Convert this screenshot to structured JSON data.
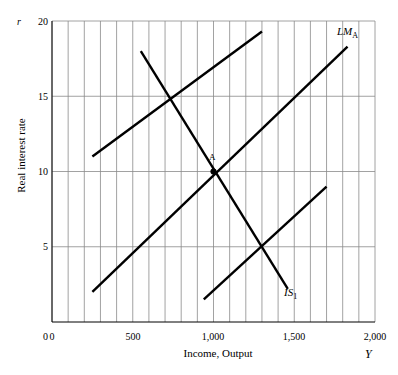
{
  "chart_data": {
    "type": "line",
    "title": "",
    "xlabel": "Income, Output",
    "ylabel": "Real interest rate",
    "x_symbol": "Y",
    "y_symbol": "r",
    "xlim": [
      0,
      2000
    ],
    "ylim": [
      0,
      20
    ],
    "xticks": [
      0,
      500,
      1000,
      1500,
      2000
    ],
    "xtick_labels": [
      "0",
      "500",
      "1,000",
      "1,500",
      "2,000"
    ],
    "yticks": [
      0,
      5,
      10,
      15,
      20
    ],
    "ytick_labels": [
      "0",
      "5",
      "10",
      "15",
      "20"
    ],
    "grid": {
      "vertical_step": 100,
      "horizontal_at": [
        5,
        10,
        15,
        20
      ],
      "color": "#808080"
    },
    "series": [
      {
        "name": "LM original",
        "label": "",
        "type": "segment",
        "points": [
          [
            250,
            11.0
          ],
          [
            1300,
            19.3
          ]
        ],
        "color": "#000000"
      },
      {
        "name": "IS1",
        "label": "IS",
        "label_sub": "1",
        "type": "segment",
        "points": [
          [
            550,
            18.0
          ],
          [
            1460,
            2.2
          ]
        ],
        "color": "#000000"
      },
      {
        "name": "LM A",
        "label": "LM",
        "label_sub": "A",
        "type": "segment",
        "points": [
          [
            250,
            2.0
          ],
          [
            1830,
            18.3
          ]
        ],
        "color": "#000000"
      },
      {
        "name": "IS shifted",
        "label": "",
        "type": "segment",
        "points": [
          [
            940,
            1.5
          ],
          [
            1700,
            9.0
          ]
        ],
        "color": "#000000"
      }
    ],
    "annotations": [
      {
        "name": "point-a",
        "label": "A",
        "x": 1000,
        "y": 10,
        "marker": "dot"
      }
    ],
    "legend_position": "none"
  },
  "labels": {
    "curve_lm": "LM",
    "curve_lm_sub": "A",
    "curve_is": "IS",
    "curve_is_sub": "1",
    "point_a": "A",
    "axis_x_title": "Income, Output",
    "axis_y_title": "Real interest rate",
    "axis_x_symbol": "Y",
    "axis_y_symbol": "r",
    "xtick_0": "0",
    "xtick_500": "500",
    "xtick_1000": "1,000",
    "xtick_1500": "1,500",
    "xtick_2000": "2,000",
    "ytick_0": "0",
    "ytick_5": "5",
    "ytick_10": "10",
    "ytick_15": "15",
    "ytick_20": "20"
  }
}
